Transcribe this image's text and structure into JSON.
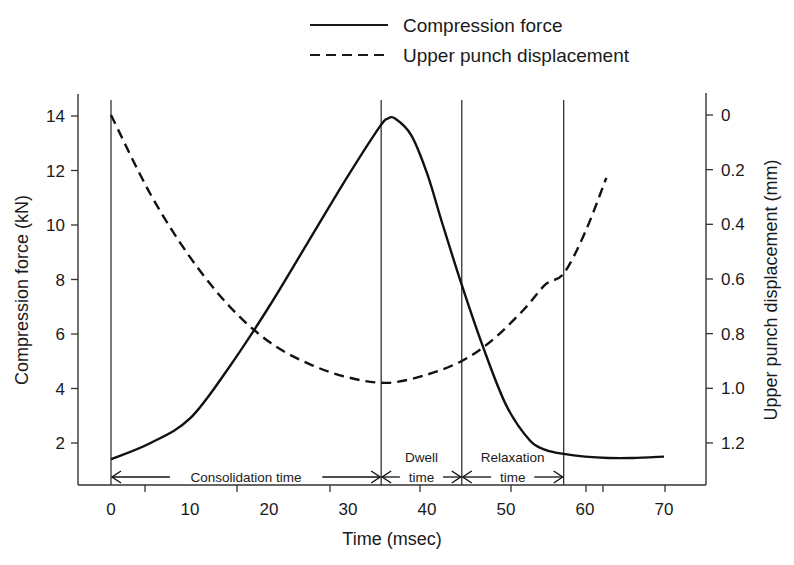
{
  "chart_data": {
    "type": "line",
    "title": "",
    "xlabel": "Time (msec)",
    "ylabel": "Compression force (kN)",
    "y2label": "Upper punch displacement (mm)",
    "xlim": [
      0,
      70
    ],
    "ylim": [
      1,
      14.5
    ],
    "y2lim": [
      0,
      1.4
    ],
    "y2_inverted": true,
    "x_ticks": [
      0,
      10,
      20,
      30,
      40,
      50,
      60,
      70
    ],
    "y_ticks": [
      2,
      4,
      6,
      8,
      10,
      12,
      14
    ],
    "y2_ticks": [
      "0",
      "0.2",
      "0.4",
      "0.6",
      "0.8",
      "1.0",
      "1.2"
    ],
    "grid": false,
    "legend": {
      "position": "top",
      "entries": [
        {
          "label": "Compression force",
          "style": "solid"
        },
        {
          "label": "Upper punch displacement",
          "style": "dashed"
        }
      ]
    },
    "series": [
      {
        "name": "Compression force",
        "axis": "left",
        "unit": "kN",
        "x": [
          0,
          5,
          10,
          15,
          20,
          25,
          30,
          34,
          35,
          36,
          38,
          40,
          42,
          44.4,
          47,
          50,
          53,
          55,
          57.3,
          60,
          63,
          66,
          70
        ],
        "y": [
          1.4,
          2.0,
          2.9,
          4.8,
          7.0,
          9.4,
          11.8,
          13.6,
          13.9,
          13.9,
          13.3,
          11.9,
          10.0,
          7.8,
          5.6,
          3.4,
          2.1,
          1.75,
          1.6,
          1.5,
          1.45,
          1.45,
          1.5
        ]
      },
      {
        "name": "Upper punch displacement",
        "axis": "right",
        "unit": "mm",
        "x": [
          0,
          5,
          10,
          15,
          20,
          25,
          30,
          35,
          40,
          44.4,
          48,
          52,
          55,
          57.3,
          60,
          62.7
        ],
        "y": [
          0.0,
          0.29,
          0.52,
          0.7,
          0.83,
          0.91,
          0.96,
          0.98,
          0.95,
          0.9,
          0.83,
          0.72,
          0.62,
          0.58,
          0.43,
          0.23
        ]
      }
    ],
    "annotations": {
      "phase_lines_msec": [
        0,
        34.2,
        44.4,
        57.3
      ],
      "phases": [
        {
          "label_line1": "Consolidation time",
          "label_line2": "",
          "from": 0,
          "to": 34.2
        },
        {
          "label_line1": "Dwell",
          "label_line2": "time",
          "from": 34.2,
          "to": 44.4
        },
        {
          "label_line1": "Relaxation",
          "label_line2": "time",
          "from": 44.4,
          "to": 57.3
        }
      ]
    }
  }
}
